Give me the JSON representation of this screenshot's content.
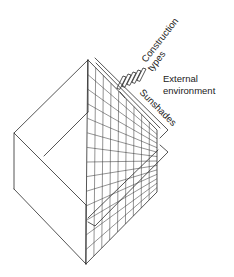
{
  "diagram": {
    "labels": {
      "construction": "Construction",
      "types": "types",
      "external": "External",
      "environment": "environment",
      "sunshades": "Sunshades"
    },
    "grid": {
      "columns": 9,
      "rows": 14
    },
    "colors": {
      "line": "#2a2a2a",
      "background": "#ffffff"
    }
  }
}
